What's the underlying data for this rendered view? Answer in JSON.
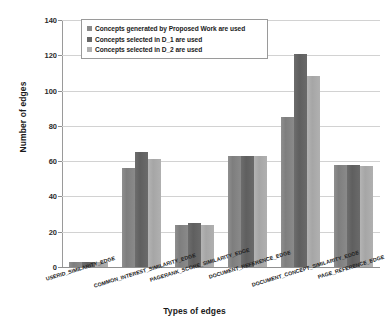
{
  "chart_data": {
    "type": "bar",
    "title": "",
    "xlabel": "Types of edges",
    "ylabel": "Number of edges",
    "ylim": [
      0,
      140
    ],
    "ytick_labels": [
      "140",
      "120",
      "100",
      "80",
      "60",
      "40",
      "20",
      "0"
    ],
    "ytick_values": [
      140,
      120,
      100,
      80,
      60,
      40,
      20,
      0
    ],
    "grid": true,
    "legend_position": "top-left-inside",
    "categories": [
      "USERID_SIMILARITY_EDGE",
      "COMMON_INTEREST_SIMILARITY_EDGE",
      "PAGERANK_SCORE_SIMILARITY_EDGE",
      "DOCUMENT_REFERENCE_EDGE",
      "DOCUMENT_CONCEPT_SIMILARITY_EDGE",
      "PAGE_REFERENCE_EDGE"
    ],
    "series": [
      {
        "name": "Concepts generated by Proposed Work are used",
        "color": "#8a8a8a",
        "values": [
          3,
          56,
          24,
          63,
          85,
          58
        ]
      },
      {
        "name": "Concepts selected in D_1 are used",
        "color": "#676767",
        "values": [
          3,
          65,
          25,
          63,
          121,
          58
        ]
      },
      {
        "name": "Concepts selected in D_2 are used",
        "color": "#b0b0b0",
        "values": [
          3,
          61,
          24,
          63,
          108,
          57
        ]
      }
    ]
  }
}
